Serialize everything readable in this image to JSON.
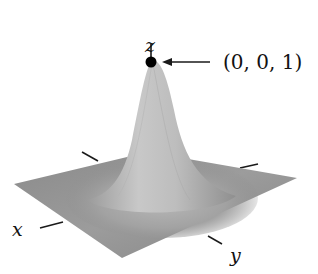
{
  "figure": {
    "type": "3d-surface-plot",
    "colors": {
      "surface_light": "#c9c9c9",
      "surface_mid": "#a8a8a8",
      "surface_dark": "#7d7d7d",
      "axis": "#1a1a1a",
      "peak_dot": "#000000"
    }
  },
  "axes": {
    "x_label": "x",
    "y_label": "y",
    "z_label": "z"
  },
  "annotation": {
    "point_label": "(0, 0, 1)",
    "arrow_direction": "left"
  }
}
